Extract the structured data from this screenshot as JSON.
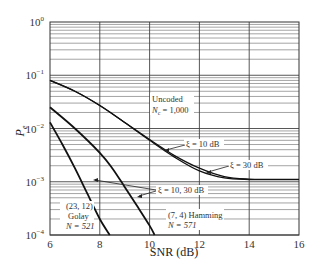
{
  "chart_data": {
    "type": "line",
    "title": "",
    "xlabel": "SNR (dB)",
    "ylabel": "P_e",
    "xlim": [
      6,
      16
    ],
    "ylim": [
      0.0001,
      1
    ],
    "yscale": "log",
    "grid": true,
    "x_ticks": [
      "6",
      "8",
      "10",
      "12",
      "14",
      "16"
    ],
    "y_ticks": [
      {
        "base": "10",
        "exp": "0"
      },
      {
        "base": "10",
        "exp": "−1"
      },
      {
        "base": "10",
        "exp": "−2"
      },
      {
        "base": "10",
        "exp": "−3"
      },
      {
        "base": "10",
        "exp": "−4"
      }
    ],
    "series": [
      {
        "name": "Uncoded, N_c = 1,000 (ξ = 10 dB)",
        "x": [
          6,
          7,
          8,
          9,
          10,
          11,
          12,
          13,
          14,
          15,
          16
        ],
        "y": [
          0.08,
          0.05,
          0.027,
          0.013,
          0.0062,
          0.0031,
          0.0018,
          0.00125,
          0.00112,
          0.00111,
          0.00111
        ]
      },
      {
        "name": "Uncoded, N_c = 1,000 (ξ = 30 dB)",
        "x": [
          6,
          7,
          8,
          9,
          10,
          11,
          12,
          13,
          14,
          15,
          16
        ],
        "y": [
          0.08,
          0.05,
          0.027,
          0.013,
          0.006,
          0.0029,
          0.0016,
          0.00118,
          0.0011,
          0.0011,
          0.0011
        ]
      },
      {
        "name": "(7, 4) Hamming, N = 571",
        "x": [
          6,
          7,
          8,
          8.5,
          9,
          9.5,
          10,
          10.2
        ],
        "y": [
          0.025,
          0.01,
          0.0035,
          0.0018,
          0.0008,
          0.00035,
          0.00015,
          0.0001
        ]
      },
      {
        "name": "(23, 12) Golay, N = 521",
        "x": [
          6,
          6.5,
          7,
          7.5,
          8,
          8.4
        ],
        "y": [
          0.013,
          0.005,
          0.0018,
          0.0006,
          0.0002,
          0.0001
        ]
      }
    ],
    "annotations": [
      {
        "text": "Uncoded",
        "x": 10.2,
        "y": 0.025
      },
      {
        "text": "N_c = 1,000",
        "x": 10.2,
        "y": 0.017
      },
      {
        "text": "ξ = 10 dB",
        "x": 11.6,
        "y": 0.0045
      },
      {
        "text": "ξ = 30 dB",
        "x": 13.3,
        "y": 0.0021
      },
      {
        "text": "ξ = 10, 30 dB",
        "x": 10.3,
        "y": 0.0008
      },
      {
        "text": "(23, 12)",
        "x": 6.4,
        "y": 0.00042
      },
      {
        "text": "Golay",
        "x": 6.4,
        "y": 0.00027
      },
      {
        "text": "N = 521",
        "x": 6.4,
        "y": 0.00017
      },
      {
        "text": "(7, 4) Hamming",
        "x": 10.5,
        "y": 0.00024
      },
      {
        "text": "N = 571",
        "x": 10.5,
        "y": 0.00016
      }
    ]
  },
  "labels": {
    "xlabel": "SNR (dB)",
    "ylabel_main": "P",
    "ylabel_sub": "e",
    "uncoded": "Uncoded",
    "nc_main": "N",
    "nc_sub": "c",
    "nc_val": " = 1,000",
    "xi10": "ξ = 10 dB",
    "xi30": "ξ = 30 dB",
    "xi1030": "ξ = 10, 30 dB",
    "golay1": "(23, 12)",
    "golay2": "Golay",
    "golay3": "N = 521",
    "hamming1": "(7, 4) Hamming",
    "hamming2": "N = 571"
  }
}
